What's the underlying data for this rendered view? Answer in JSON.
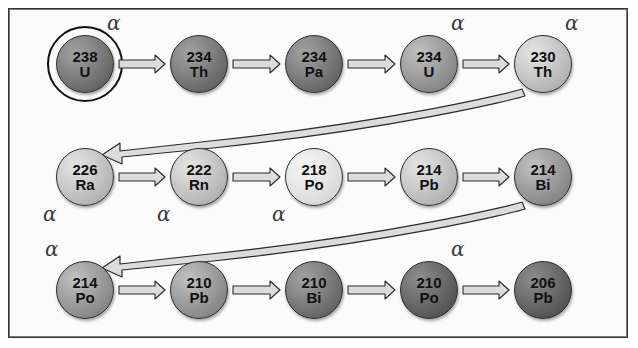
{
  "diagram": {
    "panel": {
      "background": "#fbfbfb",
      "border_color": "#333333"
    },
    "decay_label": "α",
    "rows": [
      {
        "row_index": 1,
        "nodes": [
          {
            "mass": "238",
            "symbol": "U",
            "shade": "sh-dark",
            "ringed": true,
            "alpha": "α",
            "alpha_pos": "top-right"
          },
          {
            "mass": "234",
            "symbol": "Th",
            "shade": "sh-dark",
            "ringed": false,
            "alpha": "",
            "alpha_pos": ""
          },
          {
            "mass": "234",
            "symbol": "Pa",
            "shade": "sh-dark",
            "ringed": false,
            "alpha": "",
            "alpha_pos": ""
          },
          {
            "mass": "234",
            "symbol": "U",
            "shade": "sh-mid",
            "ringed": false,
            "alpha": "α",
            "alpha_pos": "top-right"
          },
          {
            "mass": "230",
            "symbol": "Th",
            "shade": "sh-light",
            "ringed": false,
            "alpha": "α",
            "alpha_pos": "top-right"
          }
        ]
      },
      {
        "row_index": 2,
        "nodes": [
          {
            "mass": "226",
            "symbol": "Ra",
            "shade": "sh-light",
            "ringed": false,
            "alpha": "α",
            "alpha_pos": "bottom-left"
          },
          {
            "mass": "222",
            "symbol": "Rn",
            "shade": "sh-light",
            "ringed": false,
            "alpha": "α",
            "alpha_pos": "bottom-left"
          },
          {
            "mass": "218",
            "symbol": "Po",
            "shade": "sh-pale",
            "ringed": false,
            "alpha": "α",
            "alpha_pos": "bottom-left"
          },
          {
            "mass": "214",
            "symbol": "Pb",
            "shade": "sh-light",
            "ringed": false,
            "alpha": "",
            "alpha_pos": ""
          },
          {
            "mass": "214",
            "symbol": "Bi",
            "shade": "sh-mid",
            "ringed": false,
            "alpha": "",
            "alpha_pos": ""
          }
        ]
      },
      {
        "row_index": 3,
        "nodes": [
          {
            "mass": "214",
            "symbol": "Po",
            "shade": "sh-mid",
            "ringed": false,
            "alpha": "α",
            "alpha_pos": "top-left"
          },
          {
            "mass": "210",
            "symbol": "Pb",
            "shade": "sh-mid",
            "ringed": false,
            "alpha": "",
            "alpha_pos": ""
          },
          {
            "mass": "210",
            "symbol": "Bi",
            "shade": "sh-dark",
            "ringed": false,
            "alpha": "",
            "alpha_pos": ""
          },
          {
            "mass": "210",
            "symbol": "Po",
            "shade": "sh-darker",
            "ringed": false,
            "alpha": "α",
            "alpha_pos": "top-right"
          },
          {
            "mass": "206",
            "symbol": "Pb",
            "shade": "sh-darker",
            "ringed": false,
            "alpha": "",
            "alpha_pos": ""
          }
        ]
      }
    ],
    "connectors": [
      {
        "name": "row1-to-row2",
        "from": "230 Th",
        "to": "226 Ra"
      },
      {
        "name": "row2-to-row3",
        "from": "214 Bi",
        "to": "214 Po"
      }
    ]
  }
}
